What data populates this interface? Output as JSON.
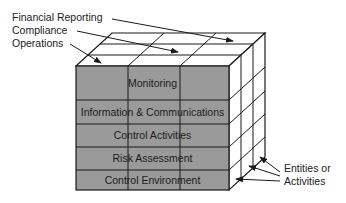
{
  "diagram": {
    "objectives": [
      {
        "label": "Financial Reporting"
      },
      {
        "label": "Compliance"
      },
      {
        "label": "Operations"
      }
    ],
    "components": [
      {
        "label": "Monitoring"
      },
      {
        "label": "Information & Communications"
      },
      {
        "label": "Control Activities"
      },
      {
        "label": "Risk Assessment"
      },
      {
        "label": "Control Environment"
      }
    ],
    "side_label": {
      "line1": "Entities or",
      "line2": "Activities"
    },
    "colors": {
      "front_face": "#9a9a9a",
      "top_face": "#ffffff",
      "side_face": "#ffffff",
      "lines": "#1a1a1a"
    }
  }
}
